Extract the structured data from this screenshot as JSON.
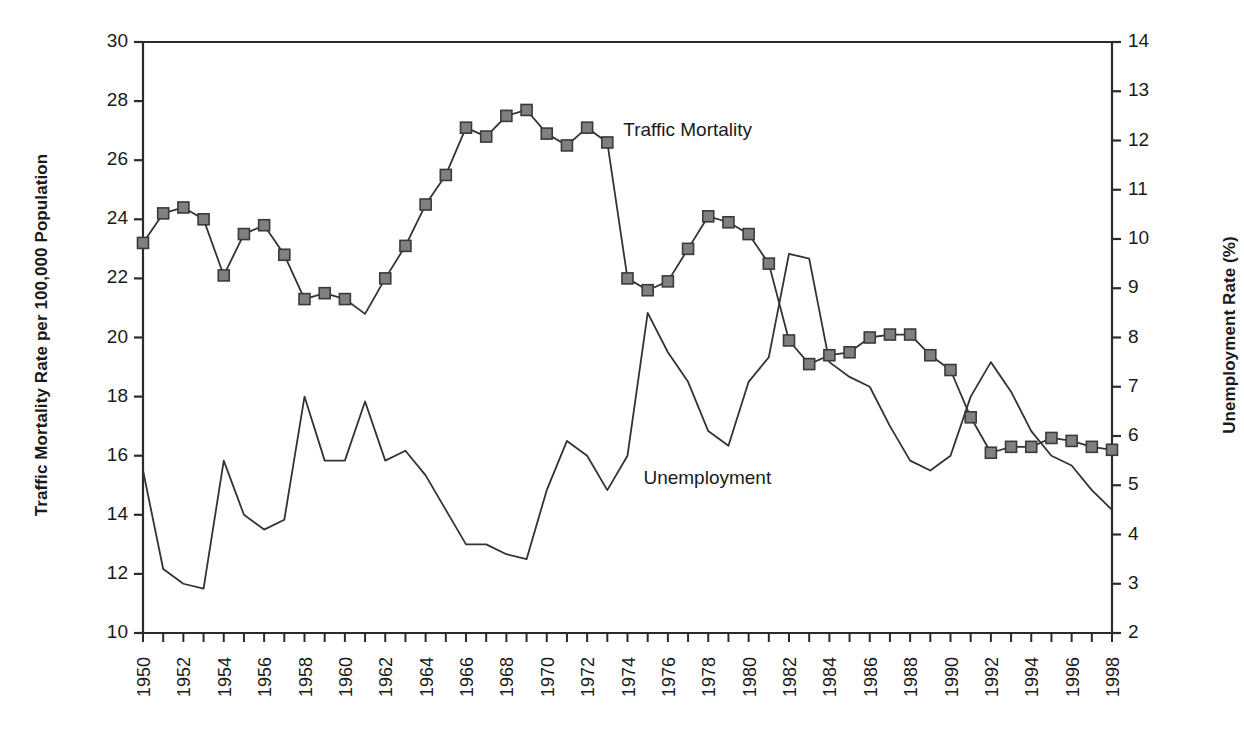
{
  "chart_data": {
    "type": "line",
    "title": "",
    "xlabel": "",
    "ylabel": "Traffic Mortality Rate per 100,000 Population",
    "ylabel_right": "Unemployment Rate (%)",
    "ylim": [
      10,
      30
    ],
    "ylim_right": [
      2,
      14
    ],
    "xlim": [
      1950,
      1998
    ],
    "grid": false,
    "legend_position": "inline-annotations",
    "x_tick_step": 2,
    "x_minor_tick_step": 1,
    "y_tick_step_left": 2,
    "y_tick_step_right": 1,
    "x": [
      1950,
      1951,
      1952,
      1953,
      1954,
      1955,
      1956,
      1957,
      1958,
      1959,
      1960,
      1961,
      1962,
      1963,
      1964,
      1965,
      1966,
      1967,
      1968,
      1969,
      1970,
      1971,
      1972,
      1973,
      1974,
      1975,
      1976,
      1977,
      1978,
      1979,
      1980,
      1981,
      1982,
      1983,
      1984,
      1985,
      1986,
      1987,
      1988,
      1989,
      1990,
      1991,
      1992,
      1993,
      1994,
      1995,
      1996,
      1997,
      1998
    ],
    "x_tick_labels": [
      "1950",
      "1952",
      "1954",
      "1956",
      "1958",
      "1960",
      "1962",
      "1964",
      "1966",
      "1968",
      "1970",
      "1972",
      "1974",
      "1976",
      "1978",
      "1980",
      "1982",
      "1984",
      "1986",
      "1988",
      "1990",
      "1992",
      "1994",
      "1996",
      "1998"
    ],
    "y_tick_labels_left": [
      "30",
      "28",
      "26",
      "24",
      "22",
      "20",
      "18",
      "16",
      "14",
      "12",
      "10"
    ],
    "y_tick_labels_right": [
      "14",
      "13",
      "12",
      "11",
      "10",
      "9",
      "8",
      "7",
      "6",
      "5",
      "4",
      "3",
      "2"
    ],
    "series": [
      {
        "name": "Traffic Mortality",
        "axis": "left",
        "marker": "square",
        "marker_color": "#808080",
        "line_color": "#333333",
        "values": [
          23.2,
          24.2,
          24.4,
          24.0,
          22.1,
          23.5,
          23.8,
          22.8,
          21.3,
          21.5,
          21.3,
          20.8,
          22.0,
          23.1,
          24.5,
          25.5,
          27.1,
          26.8,
          27.5,
          27.7,
          26.9,
          26.5,
          27.1,
          26.6,
          22.0,
          21.6,
          21.9,
          23.0,
          24.1,
          23.9,
          23.5,
          22.5,
          19.9,
          19.1,
          19.4,
          19.5,
          20.0,
          20.1,
          20.1,
          19.4,
          18.9,
          17.3,
          16.1,
          16.3,
          16.3,
          16.6,
          16.5,
          16.3,
          16.2
        ]
      },
      {
        "name": "Unemployment",
        "axis": "right",
        "marker": "none",
        "line_color": "#333333",
        "values": [
          5.3,
          3.3,
          3.0,
          2.9,
          5.5,
          4.4,
          4.1,
          4.3,
          6.8,
          5.5,
          5.5,
          6.7,
          5.5,
          5.7,
          5.2,
          4.5,
          3.8,
          3.8,
          3.6,
          3.5,
          4.9,
          5.9,
          5.6,
          4.9,
          5.6,
          8.5,
          7.7,
          7.1,
          6.1,
          5.8,
          7.1,
          7.6,
          9.7,
          9.6,
          7.5,
          7.2,
          7.0,
          6.2,
          5.5,
          5.3,
          5.6,
          6.8,
          7.5,
          6.9,
          6.1,
          5.6,
          5.4,
          4.9,
          4.5
        ]
      }
    ],
    "annotations": [
      {
        "text": "Traffic Mortality",
        "x": 1978,
        "y": 27.0
      },
      {
        "text": "Unemployment",
        "x": 1979,
        "y": 15.2
      }
    ]
  },
  "plot": {
    "left": 143,
    "top": 42,
    "right": 1112,
    "bottom": 633
  }
}
